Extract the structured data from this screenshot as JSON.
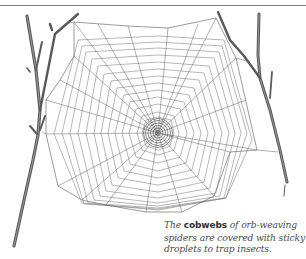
{
  "figure": {
    "colors": {
      "line": "#6e6e6e",
      "twig": "#5a5a5a",
      "rule": "#7a7a7a",
      "caption_text": "#4a4a4a"
    }
  },
  "caption": {
    "prefix": "The ",
    "keyword": "cobwebs",
    "line1_rest": " of orb-weaving",
    "line2": "spiders are covered with sticky",
    "line3": "droplets to trap insects."
  }
}
